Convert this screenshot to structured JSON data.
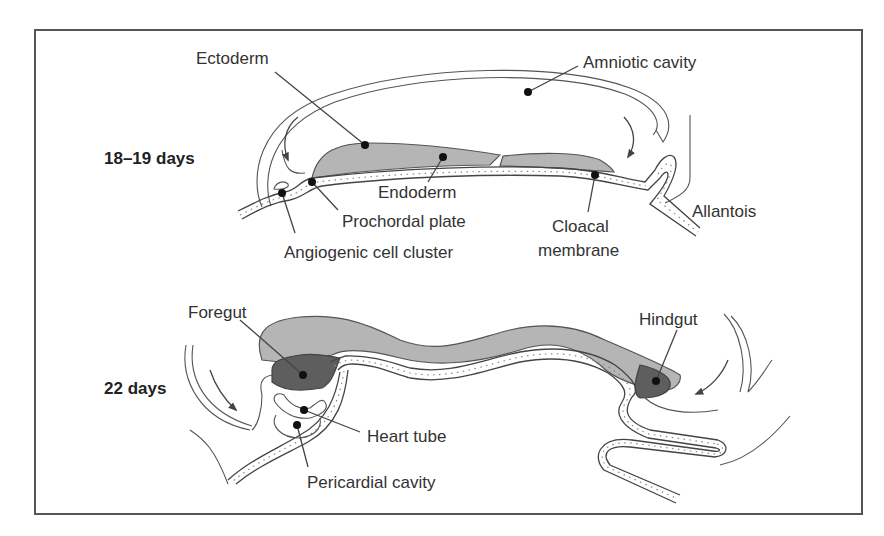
{
  "figure": {
    "type": "embryology-diagram",
    "colors": {
      "frame": "#555555",
      "ectoderm_fill": "#b5b5b5",
      "gut_fill": "#5e5e5e",
      "text": "#333333"
    }
  },
  "panels": [
    {
      "stage": "18–19 days",
      "labels": {
        "ectoderm": "Ectoderm",
        "amniotic_cavity": "Amniotic cavity",
        "endoderm": "Endoderm",
        "prochordal_plate": "Prochordal plate",
        "angiogenic_cell_cluster": "Angiogenic cell cluster",
        "cloacal_membrane_line1": "Cloacal",
        "cloacal_membrane_line2": "membrane",
        "allantois": "Allantois"
      }
    },
    {
      "stage": "22 days",
      "labels": {
        "foregut": "Foregut",
        "hindgut": "Hindgut",
        "heart_tube": "Heart tube",
        "pericardial_cavity": "Pericardial cavity"
      }
    }
  ]
}
